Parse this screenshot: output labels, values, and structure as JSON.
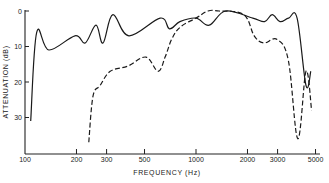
{
  "chart_data": {
    "type": "line",
    "title": "",
    "xlabel": "FREQUENCY (Hz)",
    "ylabel": "ATTENUATION (dB)",
    "x_scale": "log",
    "xlim": [
      100,
      5000
    ],
    "ylim": [
      0,
      40
    ],
    "y_inverted": true,
    "x_ticks": [
      100,
      200,
      300,
      500,
      1000,
      2000,
      3000,
      5000
    ],
    "x_tick_labels": [
      "100",
      "200",
      "300",
      "500",
      "1000",
      "2000",
      "3000",
      "5000"
    ],
    "y_ticks": [
      0,
      10,
      20,
      30
    ],
    "y_tick_labels": [
      "0",
      "10",
      "20",
      "30"
    ],
    "grid": false,
    "legend": null,
    "series": [
      {
        "name": "solid",
        "style": "solid",
        "x": [
          108,
          117,
          138,
          196,
          225,
          260,
          286,
          326,
          405,
          617,
          700,
          805,
          1000,
          1195,
          1490,
          2150,
          2520,
          2790,
          3100,
          3480,
          3900,
          4400,
          4690
        ],
        "values": [
          31,
          6,
          11,
          7,
          9,
          4,
          9,
          1,
          7,
          2,
          5,
          3,
          2,
          4,
          0,
          2,
          3,
          1,
          3,
          2,
          2,
          21,
          17
        ]
      },
      {
        "name": "dashed",
        "style": "dashed",
        "x": [
          236,
          250,
          275,
          315,
          400,
          510,
          600,
          660,
          720,
          810,
          1000,
          1175,
          1365,
          1900,
          2190,
          2490,
          2980,
          3470,
          3940,
          4400,
          4740
        ],
        "values": [
          37,
          24,
          21,
          17,
          15.5,
          13,
          17,
          13,
          8,
          4.5,
          2,
          0,
          0,
          1,
          7,
          9,
          8,
          14,
          36,
          17,
          28
        ]
      }
    ]
  }
}
